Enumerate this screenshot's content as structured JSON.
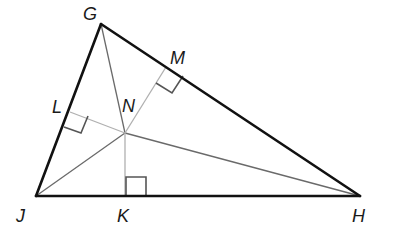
{
  "diagram": {
    "type": "triangle-incenter",
    "vertices": {
      "G": "G",
      "J": "J",
      "H": "H"
    },
    "feet": {
      "L": "L",
      "M": "M",
      "K": "K"
    },
    "center": "N",
    "sides": [
      "GJ",
      "GH",
      "JH"
    ],
    "angle_bisectors": [
      "GN",
      "JN",
      "HN"
    ],
    "perpendiculars": [
      "NL",
      "NM",
      "NK"
    ],
    "right_angle_marks": [
      "L",
      "M",
      "K"
    ]
  }
}
